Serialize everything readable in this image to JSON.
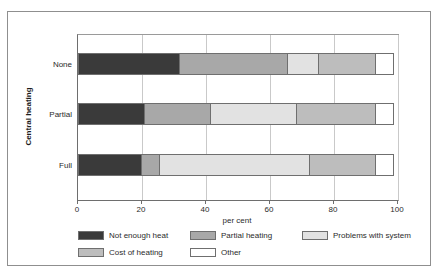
{
  "caption_ghost": "",
  "axes": {
    "y_title": "Central heating",
    "x_title": "per cent",
    "x_ticks": [
      "0",
      "20",
      "40",
      "60",
      "80",
      "100"
    ]
  },
  "legend": [
    {
      "label": "Not enough heat",
      "color": "#3a3a3a"
    },
    {
      "label": "Partial heating",
      "color": "#a8a8a8"
    },
    {
      "label": "Problems with system",
      "color": "#e2e2e2"
    },
    {
      "label": "Cost of heating",
      "color": "#bdbdbd"
    },
    {
      "label": "Other",
      "color": "#ffffff"
    }
  ],
  "chart_data": {
    "type": "bar",
    "orientation": "horizontal",
    "stacked": true,
    "title": "",
    "xlabel": "per cent",
    "ylabel": "Central heating",
    "xlim": [
      0,
      100
    ],
    "xticks": [
      0,
      20,
      40,
      60,
      80,
      100
    ],
    "grid": true,
    "legend_position": "bottom",
    "categories": [
      "None",
      "Partial",
      "Full"
    ],
    "series": [
      {
        "name": "Not enough heat",
        "color": "#3a3a3a",
        "values": [
          32,
          21,
          20
        ]
      },
      {
        "name": "Partial heating",
        "color": "#a8a8a8",
        "values": [
          34,
          21,
          6
        ]
      },
      {
        "name": "Problems with system",
        "color": "#e2e2e2",
        "values": [
          10,
          27,
          47
        ]
      },
      {
        "name": "Cost of heating",
        "color": "#bdbdbd",
        "values": [
          18,
          25,
          21
        ]
      },
      {
        "name": "Other",
        "color": "#ffffff",
        "values": [
          6,
          6,
          6
        ]
      }
    ],
    "cumulative_boundaries": {
      "None": [
        32,
        66,
        76,
        94,
        100
      ],
      "Partial": [
        21,
        42,
        69,
        94,
        100
      ],
      "Full": [
        20,
        26,
        73,
        94,
        100
      ]
    }
  }
}
